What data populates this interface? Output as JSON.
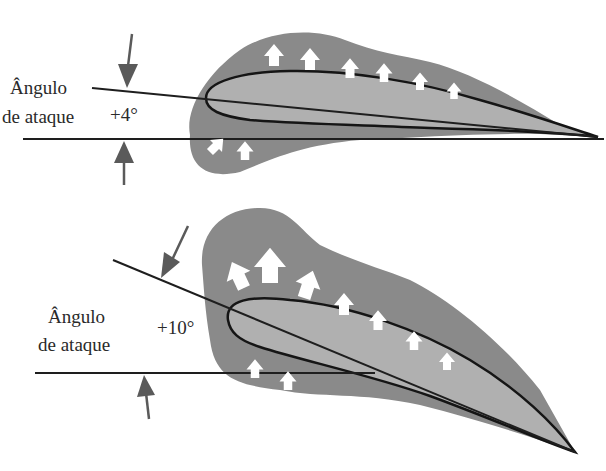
{
  "diagram": {
    "colors": {
      "pressure_field": "#8a8a8a",
      "airfoil_fill": "#b0b0b0",
      "outline": "#151515",
      "arrow_fill": "#ffffff",
      "indicator_arrow": "#5a5a5a",
      "background": "#ffffff"
    },
    "panels": [
      {
        "id": "top",
        "label_line1": "Ângulo",
        "label_line2": "de ataque",
        "angle": "+4°"
      },
      {
        "id": "bottom",
        "label_line1": "Ângulo",
        "label_line2": "de ataque",
        "angle": "+10°"
      }
    ]
  }
}
